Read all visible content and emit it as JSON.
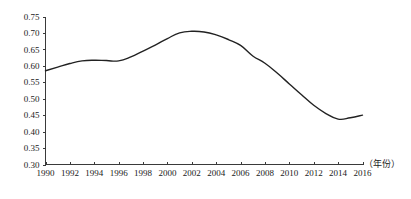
{
  "chart_data": {
    "type": "line",
    "title": "",
    "subtitle": "",
    "xlabel": "（年份）",
    "ylabel": "",
    "grid": false,
    "legend": false,
    "legend_position": "none",
    "xlim": [
      1990,
      2016
    ],
    "ylim": [
      0.3,
      0.75
    ],
    "y_ticks": [
      "0.30",
      "0.35",
      "0.40",
      "0.45",
      "0.50",
      "0.55",
      "0.60",
      "0.65",
      "0.70",
      "0.75"
    ],
    "y_tick_values": [
      0.3,
      0.35,
      0.4,
      0.45,
      0.5,
      0.55,
      0.6,
      0.65,
      0.7,
      0.75
    ],
    "x_ticks": [
      "1990",
      "1992",
      "1994",
      "1996",
      "1998",
      "2000",
      "2002",
      "2004",
      "2006",
      "2008",
      "2010",
      "2012",
      "2014",
      "2016"
    ],
    "x_tick_values": [
      1990,
      1992,
      1994,
      1996,
      1998,
      2000,
      2002,
      2004,
      2006,
      2008,
      2010,
      2012,
      2014,
      2016
    ],
    "x": [
      1990,
      1991,
      1992,
      1993,
      1994,
      1995,
      1996,
      1997,
      1998,
      1999,
      2000,
      2001,
      2002,
      2003,
      2004,
      2005,
      2006,
      2007,
      2008,
      2009,
      2010,
      2011,
      2012,
      2013,
      2014,
      2015,
      2016
    ],
    "values": [
      0.585,
      0.596,
      0.607,
      0.615,
      0.617,
      0.616,
      0.615,
      0.627,
      0.645,
      0.663,
      0.683,
      0.7,
      0.705,
      0.703,
      0.694,
      0.68,
      0.662,
      0.63,
      0.608,
      0.578,
      0.545,
      0.512,
      0.48,
      0.455,
      0.438,
      0.442,
      0.45
    ],
    "series": [
      {
        "name": "series-1",
        "color": "#222222",
        "values": [
          0.585,
          0.596,
          0.607,
          0.615,
          0.617,
          0.616,
          0.615,
          0.627,
          0.645,
          0.663,
          0.683,
          0.7,
          0.705,
          0.703,
          0.694,
          0.68,
          0.662,
          0.63,
          0.608,
          0.578,
          0.545,
          0.512,
          0.48,
          0.455,
          0.438,
          0.442,
          0.45
        ]
      }
    ]
  },
  "colors": {
    "line": "#222222",
    "axis": "#3a3a3a",
    "text": "#1a1a1a",
    "background": "#ffffff"
  }
}
